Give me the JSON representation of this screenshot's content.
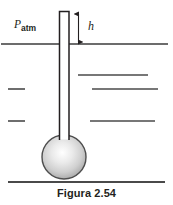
{
  "figure": {
    "caption": "Figura 2.54",
    "labels": {
      "pressure_symbol": "P",
      "pressure_subscript": "atm",
      "height_symbol": "h"
    },
    "colors": {
      "stroke": "#231f20",
      "line": "#3b3b3b",
      "bulb_light": "#ffffff",
      "bulb_mid": "#d6d6d6",
      "bulb_dark": "#9a9a9a",
      "background": "#ffffff"
    },
    "geometry": {
      "tube": {
        "x_left": 59,
        "x_right": 69.5,
        "y_top": 11,
        "y_bottom": 142
      },
      "bulb": {
        "cx": 64,
        "cy": 157,
        "r": 22
      },
      "surface_line": {
        "x1": 1,
        "x2": 168,
        "y": 44
      },
      "ground_line": {
        "x1": 8,
        "x2": 165,
        "y": 182
      },
      "dimension_arrow": {
        "x": 78.5,
        "y_top": 12,
        "y_bottom": 44
      },
      "left_marks": [
        {
          "x1": 8,
          "x2": 25,
          "y": 89
        },
        {
          "x1": 8,
          "x2": 25,
          "y": 121
        }
      ],
      "right_marks": [
        {
          "x1": 78,
          "x2": 148,
          "y": 75
        },
        {
          "x1": 92,
          "x2": 158,
          "y": 89
        },
        {
          "x1": 90,
          "x2": 155,
          "y": 121
        }
      ]
    }
  }
}
